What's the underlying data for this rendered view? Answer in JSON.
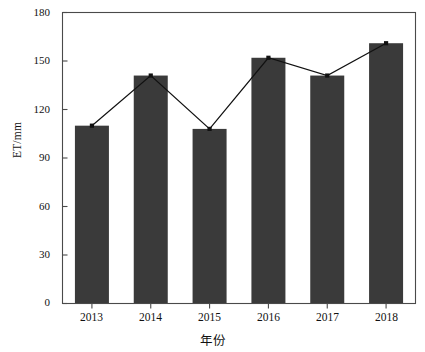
{
  "chart_data": {
    "type": "bar",
    "title": "",
    "subtitle": "",
    "xlabel": "年份",
    "ylabel": "ET/mm",
    "categories": [
      "2013",
      "2014",
      "2015",
      "2016",
      "2017",
      "2018"
    ],
    "values": [
      110,
      141,
      108,
      152,
      141,
      161
    ],
    "series": [
      {
        "name": "ET bars",
        "type": "bar",
        "values": [
          110,
          141,
          108,
          152,
          141,
          161
        ]
      },
      {
        "name": "ET trend",
        "type": "line",
        "values": [
          110,
          141,
          108,
          152,
          141,
          161
        ]
      }
    ],
    "ylim": [
      0,
      180
    ],
    "yticks": [
      0,
      30,
      60,
      90,
      120,
      150,
      180
    ],
    "ytick_labels": [
      "0",
      "30",
      "60",
      "90",
      "120",
      "150",
      "180"
    ],
    "xtick_labels": [
      "2013",
      "2014",
      "2015",
      "2016",
      "2017",
      "2018"
    ],
    "grid": false,
    "legend": null,
    "legend_position": "none",
    "colors": {
      "bar_fill": "#3a3a3a",
      "line": "#111111",
      "marker": "#111111",
      "axis": "#4a4a4a",
      "background": "#ffffff",
      "text": "#111111"
    }
  }
}
